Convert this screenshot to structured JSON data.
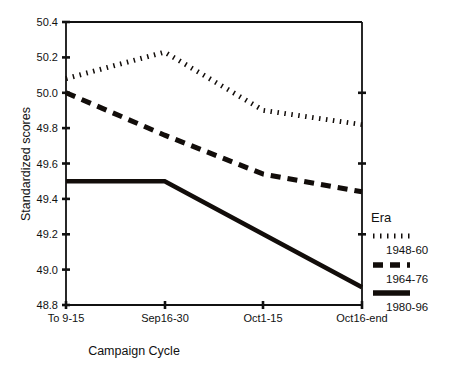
{
  "chart_data": {
    "type": "line",
    "title": "",
    "xlabel": "Campaign Cycle",
    "ylabel": "Standardized scores",
    "categories": [
      "To 9-15",
      "Sep16-30",
      "Oct1-15",
      "Oct16-end"
    ],
    "ylim": [
      48.8,
      50.4
    ],
    "yticks": [
      "48.8",
      "49.0",
      "49.2",
      "49.4",
      "49.6",
      "49.8",
      "50.0",
      "50.2",
      "50.4"
    ],
    "ytick_values": [
      48.8,
      49.0,
      49.2,
      49.4,
      49.6,
      49.8,
      50.0,
      50.2,
      50.4
    ],
    "grid": false,
    "legend_position": "right",
    "legend_title": "Era",
    "series": [
      {
        "name": "1948-60",
        "style": "dotted",
        "values": [
          50.08,
          50.23,
          49.9,
          49.82
        ]
      },
      {
        "name": "1964-76",
        "style": "dashed",
        "values": [
          50.0,
          49.76,
          49.54,
          49.44
        ]
      },
      {
        "name": "1980-96",
        "style": "solid",
        "values": [
          49.5,
          49.5,
          49.2,
          48.9
        ]
      }
    ]
  },
  "axes": {
    "y_title": "Standardized scores",
    "x_title": "Campaign Cycle",
    "y_tick_labels": [
      "50.4",
      "50.2",
      "50.0",
      "49.8",
      "49.6",
      "49.4",
      "49.2",
      "49.0",
      "48.8"
    ],
    "x_tick_labels": [
      "To 9-15",
      "Sep16-30",
      "Oct1-15",
      "Oct16-end"
    ]
  },
  "legend": {
    "title": "Era",
    "items": [
      {
        "label": "1948-60",
        "style": "dotted"
      },
      {
        "label": "1964-76",
        "style": "dashed"
      },
      {
        "label": "1980-96",
        "style": "solid"
      }
    ]
  },
  "colors": {
    "ink": "#120d0a",
    "background": "#ffffff"
  }
}
